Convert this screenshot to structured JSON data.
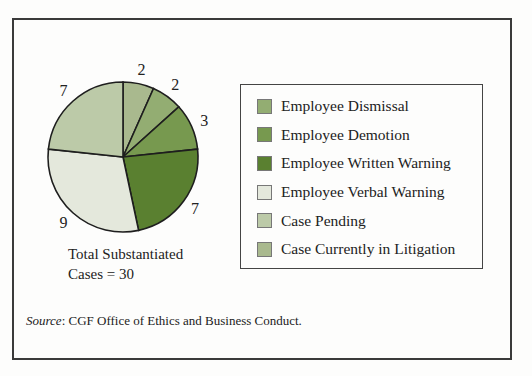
{
  "chart_data": {
    "type": "pie",
    "title": "",
    "slices": [
      {
        "label": "Case Currently in Litigation",
        "value": 2,
        "color": "#a9b98e"
      },
      {
        "label": "Employee Dismissal",
        "value": 2,
        "color": "#93ad72"
      },
      {
        "label": "Employee Demotion",
        "value": 3,
        "color": "#77994f"
      },
      {
        "label": "Employee Written Warning",
        "value": 7,
        "color": "#5a8030"
      },
      {
        "label": "Employee Verbal Warning",
        "value": 9,
        "color": "#e4e8dc"
      },
      {
        "label": "Case Pending",
        "value": 7,
        "color": "#bccaa8"
      }
    ],
    "total": 30,
    "annotation": "Total Substantiated Cases = 30",
    "legend_position": "right"
  },
  "legend": {
    "items": [
      {
        "label": "Employee Dismissal",
        "color": "#93ad72"
      },
      {
        "label": "Employee Demotion",
        "color": "#77994f"
      },
      {
        "label": "Employee Written Warning",
        "color": "#5a8030"
      },
      {
        "label": "Employee Verbal Warning",
        "color": "#e4e8dc"
      },
      {
        "label": "Case Pending",
        "color": "#bccaa8"
      },
      {
        "label": "Case Currently in Litigation",
        "color": "#a9b98e"
      }
    ]
  },
  "total_label": {
    "line1": "Total Substantiated",
    "line2": "Cases = 30"
  },
  "source": {
    "prefix": "Source",
    "text": ": CGF Office of Ethics and Business Conduct."
  }
}
